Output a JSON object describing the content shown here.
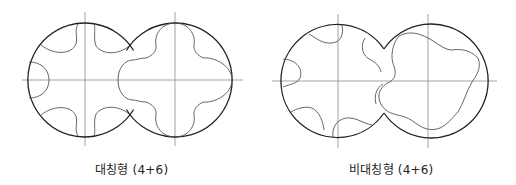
{
  "figures": [
    {
      "id": "symmetric",
      "caption": "대칭형 (4+6)",
      "type": "symmetric",
      "female_rotor_lobes": 6,
      "male_rotor_lobes": 4
    },
    {
      "id": "asymmetric",
      "caption": "비대칭형 (4+6)",
      "type": "asymmetric",
      "female_rotor_lobes": 6,
      "male_rotor_lobes": 4
    }
  ],
  "colors": {
    "outline": "#222222",
    "profile": "#555555",
    "axis": "#888888",
    "background": "#ffffff"
  }
}
